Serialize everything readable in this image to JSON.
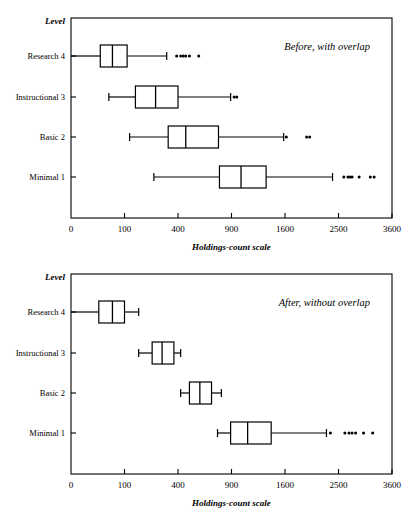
{
  "figure": {
    "title": "",
    "x_axis_label": "Holdings-count  scale",
    "y_axis_header": "Level"
  },
  "chart_data": {
    "type": "boxplot",
    "xlabel": "Holdings-count  scale",
    "ylabel": "Level",
    "grid": false,
    "legend": "none",
    "x_scale": "square-root",
    "xlim": [
      0,
      3600
    ],
    "xticks": [
      0,
      100,
      400,
      900,
      1600,
      2500,
      3600
    ],
    "xtick_labels": [
      "0",
      "100",
      "400",
      "900",
      "1600",
      "2500",
      "3600"
    ],
    "categories": [
      "Research 4",
      "Instructional 3",
      "Basic 2",
      "Minimal 1"
    ],
    "panels": [
      {
        "id": "before",
        "annotation": "Before, with overlap",
        "boxes": [
          {
            "category": "Research 4",
            "whisker_low": 0,
            "q1": 30,
            "median": 60,
            "q3": 110,
            "whisker_high": 320,
            "outliers": [
              390,
              420,
              440,
              460,
              490,
              570
            ]
          },
          {
            "category": "Instructional 3",
            "whisker_low": 50,
            "q1": 145,
            "median": 250,
            "q3": 400,
            "whisker_high": 890,
            "outliers": [
              930,
              960
            ]
          },
          {
            "category": "Basic 2",
            "whisker_low": 120,
            "q1": 330,
            "median": 460,
            "q3": 760,
            "whisker_high": 1580,
            "outliers": [
              1620,
              1940,
              1990
            ]
          },
          {
            "category": "Minimal 1",
            "whisker_low": 240,
            "q1": 770,
            "median": 1010,
            "q3": 1330,
            "whisker_high": 2390,
            "outliers": [
              2600,
              2680,
              2720,
              2760,
              2900,
              3130,
              3210
            ]
          }
        ]
      },
      {
        "id": "after",
        "annotation": "After, without overlap",
        "boxes": [
          {
            "category": "Research 4",
            "whisker_low": 0,
            "q1": 27,
            "median": 60,
            "q3": 100,
            "whisker_high": 160,
            "outliers": []
          },
          {
            "category": "Instructional 3",
            "whisker_low": 160,
            "q1": 230,
            "median": 290,
            "q3": 370,
            "whisker_high": 420,
            "outliers": []
          },
          {
            "category": "Basic 2",
            "whisker_low": 420,
            "q1": 490,
            "median": 580,
            "q3": 690,
            "whisker_high": 790,
            "outliers": []
          },
          {
            "category": "Minimal 1",
            "whisker_low": 750,
            "q1": 890,
            "median": 1090,
            "q3": 1400,
            "whisker_high": 2280,
            "outliers": [
              2350,
              2620,
              2700,
              2760,
              2830,
              2990,
              3180
            ]
          }
        ]
      }
    ]
  }
}
